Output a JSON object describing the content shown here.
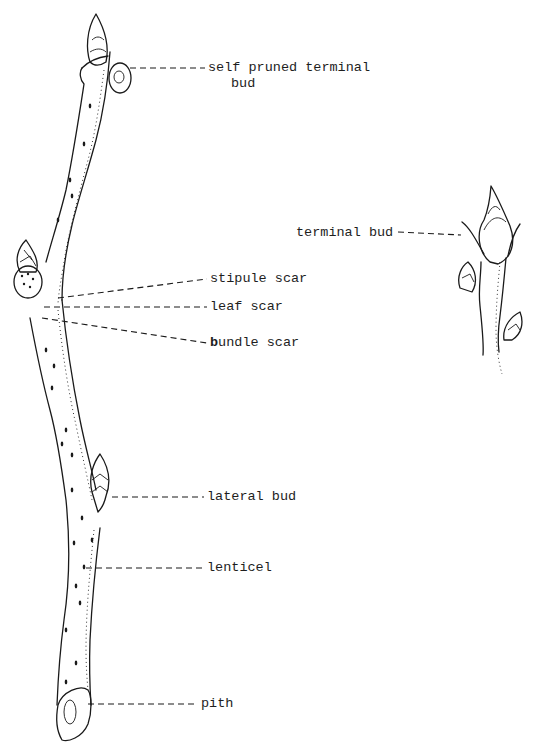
{
  "diagram": {
    "main_twig": {
      "labels": [
        {
          "id": "self-pruned-terminal-bud",
          "line1": "self pruned terminal",
          "line2": "bud"
        },
        {
          "id": "stipule-scar",
          "text": "stipule scar"
        },
        {
          "id": "leaf-scar",
          "text": "leaf scar"
        },
        {
          "id": "bundle-scar",
          "first_letter": "b",
          "rest": "undle scar"
        },
        {
          "id": "lateral-bud",
          "text": "lateral bud"
        },
        {
          "id": "lenticel",
          "text": "lenticel"
        },
        {
          "id": "pith",
          "text": "pith"
        }
      ]
    },
    "inset_twig": {
      "labels": [
        {
          "id": "terminal-bud",
          "text": "terminal bud"
        }
      ]
    },
    "colors": {
      "ink": "#1a1a1a",
      "paper": "#ffffff"
    }
  }
}
